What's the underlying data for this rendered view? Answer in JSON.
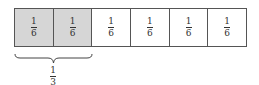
{
  "diagram": {
    "type": "fraction-bar",
    "total_parts": 6,
    "cells": [
      {
        "numerator": "1",
        "denominator": "6",
        "shaded": true
      },
      {
        "numerator": "1",
        "denominator": "6",
        "shaded": true
      },
      {
        "numerator": "1",
        "denominator": "6",
        "shaded": false
      },
      {
        "numerator": "1",
        "denominator": "6",
        "shaded": false
      },
      {
        "numerator": "1",
        "denominator": "6",
        "shaded": false
      },
      {
        "numerator": "1",
        "denominator": "6",
        "shaded": false
      }
    ],
    "brace": {
      "spans_cells": [
        0,
        1
      ],
      "label_numerator": "1",
      "label_denominator": "3"
    },
    "colors": {
      "shaded": "#d6d6d6",
      "unshaded": "#ffffff",
      "border": "#555555",
      "text": "#333333"
    }
  }
}
